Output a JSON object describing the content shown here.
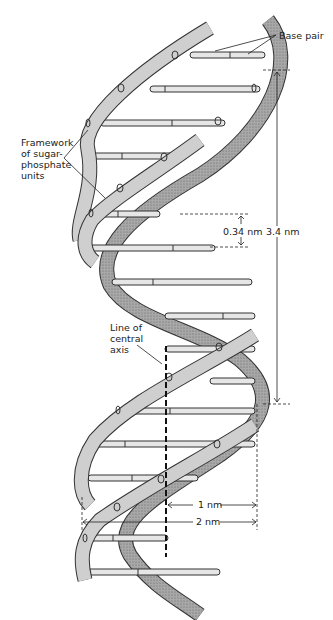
{
  "labels": {
    "base_pair": "Base pair",
    "framework": [
      "Framework",
      "of sugar-",
      "phosphate",
      "units"
    ],
    "central_axis": [
      "Line of",
      "central",
      "axis"
    ],
    "rise_per_base": "0.34 nm",
    "pitch": "3.4 nm",
    "radius": "1 nm",
    "diameter": "2 nm"
  },
  "colors": {
    "strand_fill": "#c8c8c8",
    "strand_back": "#9a9a9a",
    "strand_edge": "#333333",
    "base_fill": "#e6e6e6",
    "line": "#222222"
  }
}
